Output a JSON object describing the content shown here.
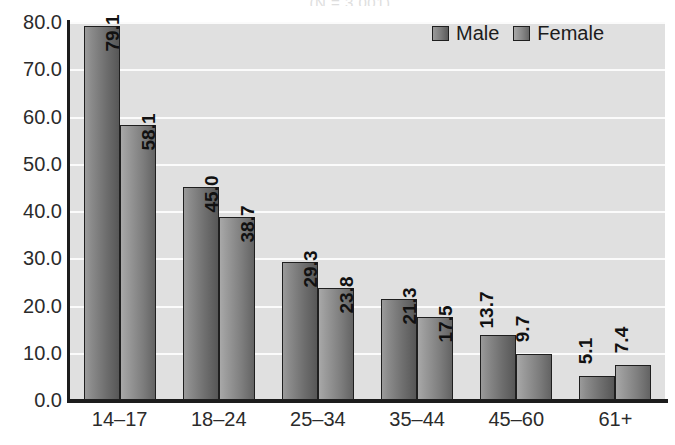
{
  "chart_data": {
    "type": "bar",
    "title": "",
    "title_remnant": "(N = 3,001)",
    "xlabel": "",
    "ylabel": "",
    "categories": [
      "14–17",
      "18–24",
      "25–34",
      "35–44",
      "45–60",
      "61+"
    ],
    "series": [
      {
        "name": "Male",
        "values": [
          79.1,
          45.0,
          29.3,
          21.3,
          13.7,
          5.1
        ]
      },
      {
        "name": "Female",
        "values": [
          58.1,
          38.7,
          23.8,
          17.5,
          9.7,
          7.4
        ]
      }
    ],
    "ylim": [
      0,
      80
    ],
    "ytick_step": 10,
    "ytick_labels": [
      "80.0",
      "70.0",
      "60.0",
      "50.0",
      "40.0",
      "30.0",
      "20.0",
      "10.0",
      "0.0"
    ],
    "ytick_values": [
      80,
      70,
      60,
      50,
      40,
      30,
      20,
      10,
      0
    ],
    "grid": true,
    "grid_axis": "y",
    "legend_position": "top-right",
    "value_labels": true,
    "value_label_rotation": -90,
    "colors": {
      "male": "#6e6e6e",
      "female": "#7d7d7d",
      "plot_background": "#e0e0e0",
      "gridline": "#fbfbfb",
      "axis": "#1c1c1c",
      "text": "#2b2b2b"
    }
  },
  "legend": {
    "items": [
      {
        "label": "Male"
      },
      {
        "label": "Female"
      }
    ]
  }
}
